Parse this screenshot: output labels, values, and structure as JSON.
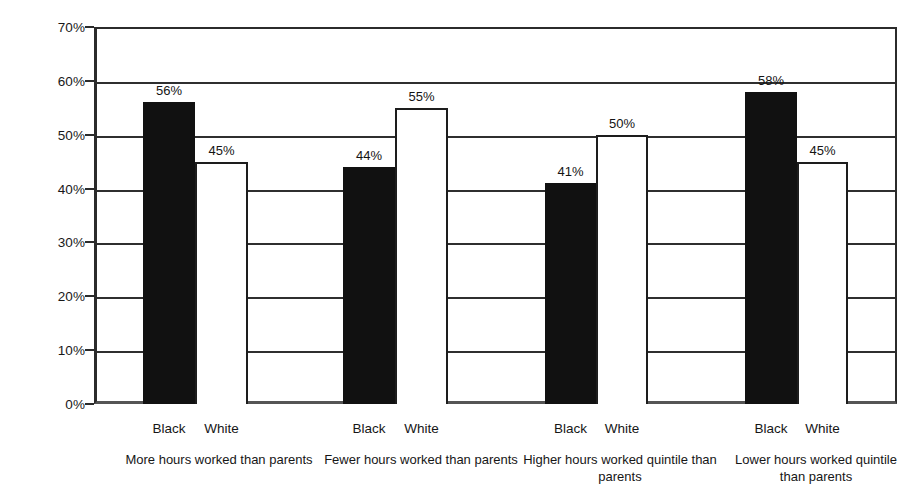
{
  "chart_data": {
    "type": "bar",
    "title": "",
    "subtitle": "",
    "xlabel": "",
    "ylabel": "",
    "ylim": [
      0,
      70
    ],
    "ytick_step": 10,
    "grid": true,
    "legend_position": "none",
    "value_suffix": "%",
    "categories": [
      "More hours worked than parents",
      "Fewer hours worked than parents",
      "Higher hours worked quintile than parents",
      "Lower hours worked quintile than parents"
    ],
    "series": [
      {
        "name": "Black",
        "color": "#111111",
        "values": [
          56,
          44,
          41,
          58
        ]
      },
      {
        "name": "White",
        "color": "#ffffff",
        "values": [
          45,
          55,
          50,
          45
        ]
      }
    ],
    "ytick_labels": [
      "70%",
      "60%",
      "50%",
      "40%",
      "30%",
      "20%",
      "10%",
      "0%"
    ],
    "ytick_values": [
      70,
      60,
      50,
      40,
      30,
      20,
      10,
      0
    ],
    "data_labels": [
      [
        "56%",
        "45%"
      ],
      [
        "44%",
        "55%"
      ],
      [
        "41%",
        "50%"
      ],
      [
        "58%",
        "45%"
      ]
    ],
    "series_tick_labels": [
      [
        "Black",
        "White"
      ],
      [
        "Black",
        "White"
      ],
      [
        "Black",
        "White"
      ],
      [
        "Black",
        "White"
      ]
    ]
  },
  "axis_colors": {
    "frame": "#2b2b2b",
    "gridline": "#2f2f2f",
    "text": "#161616"
  }
}
